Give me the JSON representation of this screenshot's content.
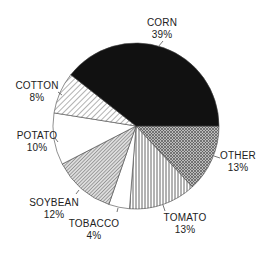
{
  "chart_data": {
    "type": "pie",
    "title": "",
    "start_angle_deg": 0,
    "direction": "clockwise",
    "slices": [
      {
        "label": "OTHER",
        "value": 13,
        "pct_label": "13%",
        "pattern": "crosshatch"
      },
      {
        "label": "TOMATO",
        "value": 13,
        "pct_label": "13%",
        "pattern": "vertical"
      },
      {
        "label": "TOBACCO",
        "value": 4,
        "pct_label": "4%",
        "pattern": "white"
      },
      {
        "label": "SOYBEAN",
        "value": 12,
        "pct_label": "12%",
        "pattern": "diagonal-dense"
      },
      {
        "label": "POTATO",
        "value": 10,
        "pct_label": "10%",
        "pattern": "white"
      },
      {
        "label": "COTTON",
        "value": 8,
        "pct_label": "8%",
        "pattern": "diagonal"
      },
      {
        "label": "CORN",
        "value": 39,
        "pct_label": "39%",
        "pattern": "solid-black"
      }
    ],
    "categories": [
      "CORN",
      "OTHER",
      "TOMATO",
      "TOBACCO",
      "SOYBEAN",
      "POTATO",
      "COTTON"
    ],
    "values": [
      39,
      13,
      13,
      4,
      12,
      10,
      8
    ]
  },
  "labels": {
    "corn": {
      "name": "CORN",
      "pct": "39%"
    },
    "other": {
      "name": "OTHER",
      "pct": "13%"
    },
    "tomato": {
      "name": "TOMATO",
      "pct": "13%"
    },
    "tobacco": {
      "name": "TOBACCO",
      "pct": "4%"
    },
    "soybean": {
      "name": "SOYBEAN",
      "pct": "12%"
    },
    "potato": {
      "name": "POTATO",
      "pct": "10%"
    },
    "cotton": {
      "name": "COTTON",
      "pct": "8%"
    }
  }
}
